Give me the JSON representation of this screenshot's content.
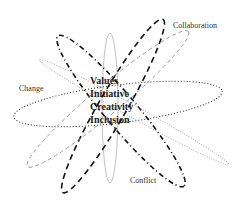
{
  "diagram": {
    "outer_labels": {
      "collaboration": "Collaboration",
      "change": "Change",
      "conflict": "Conflict"
    },
    "core_values": [
      "Values",
      "Initiative",
      "Creativity",
      "Inclusion"
    ],
    "ellipses": [
      {
        "name": "vertical-thin",
        "style": "solid-light",
        "color": "#b0b0b0"
      },
      {
        "name": "horizontal-dotted",
        "style": "dotted",
        "color": "#222222"
      },
      {
        "name": "dashdot-diagonal-down",
        "style": "dash-dot",
        "color": "#111111"
      },
      {
        "name": "dashed-diagonal-up-bold",
        "style": "dashed",
        "color": "#111111"
      },
      {
        "name": "dashed-light-up-right",
        "style": "dashed",
        "color": "#999999"
      },
      {
        "name": "dotted-light-down-right",
        "style": "dotted",
        "color": "#aaaaaa"
      }
    ]
  }
}
